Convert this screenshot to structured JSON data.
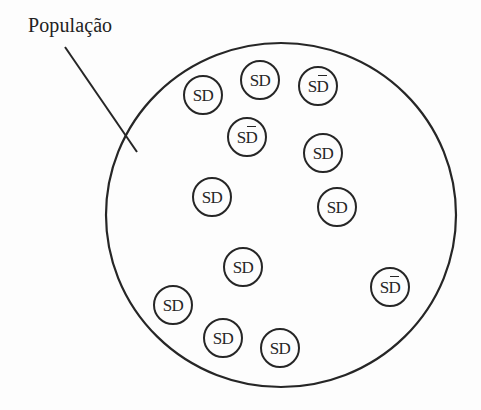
{
  "label": {
    "population": "População"
  },
  "colors": {
    "stroke": "#262626",
    "background": "#fdfdfd"
  },
  "population_circle": {
    "cx": 281,
    "cy": 215,
    "rx": 175,
    "ry": 172
  },
  "pointer_line": {
    "x1": 65,
    "y1": 47,
    "x2": 137,
    "y2": 152
  },
  "members": [
    {
      "id": 1,
      "s": "S",
      "d": "D",
      "overbar": false,
      "cx": 203,
      "cy": 95
    },
    {
      "id": 2,
      "s": "S",
      "d": "D",
      "overbar": false,
      "cx": 260,
      "cy": 80
    },
    {
      "id": 3,
      "s": "S",
      "d": "D",
      "overbar": true,
      "cx": 318,
      "cy": 86
    },
    {
      "id": 4,
      "s": "S",
      "d": "D",
      "overbar": true,
      "cx": 247,
      "cy": 137
    },
    {
      "id": 5,
      "s": "S",
      "d": "D",
      "overbar": false,
      "cx": 323,
      "cy": 153
    },
    {
      "id": 6,
      "s": "S",
      "d": "D",
      "overbar": false,
      "cx": 212,
      "cy": 197
    },
    {
      "id": 7,
      "s": "S",
      "d": "D",
      "overbar": false,
      "cx": 337,
      "cy": 207
    },
    {
      "id": 8,
      "s": "S",
      "d": "D",
      "overbar": false,
      "cx": 243,
      "cy": 267
    },
    {
      "id": 9,
      "s": "S",
      "d": "D",
      "overbar": false,
      "cx": 173,
      "cy": 305
    },
    {
      "id": 10,
      "s": "S",
      "d": "D",
      "overbar": false,
      "cx": 223,
      "cy": 338
    },
    {
      "id": 11,
      "s": "S",
      "d": "D",
      "overbar": false,
      "cx": 280,
      "cy": 348
    },
    {
      "id": 12,
      "s": "S",
      "d": "D",
      "overbar": true,
      "cx": 390,
      "cy": 287
    }
  ]
}
